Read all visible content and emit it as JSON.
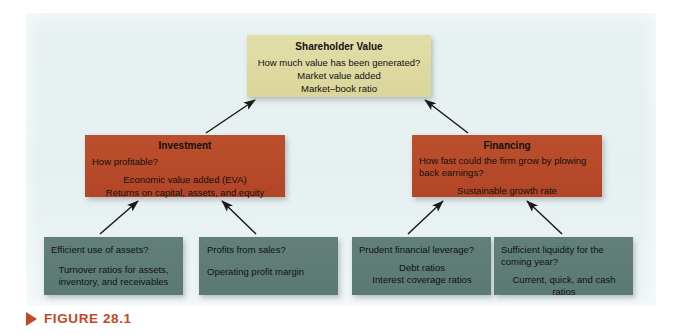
{
  "figure": {
    "caption": "FIGURE 28.1",
    "marker_icon": "triangle-right-icon",
    "caption_color": "#c0492a",
    "panel_background": "#e7f1f2"
  },
  "colors": {
    "top_box": "#ddd9a1",
    "mid_box": "#b8492a",
    "bottom_box": "#5e8078",
    "text": "#111111",
    "arrow": "#1a1a1a"
  },
  "diagram": {
    "type": "hierarchy",
    "levels": [
      {
        "level": 1,
        "nodes": [
          {
            "id": "shareholder-value",
            "title": "Shareholder Value",
            "question": "How much value has been generated?",
            "measures": [
              "Market value added",
              "Market–book ratio"
            ]
          }
        ]
      },
      {
        "level": 2,
        "nodes": [
          {
            "id": "investment",
            "title": "Investment",
            "question": "How profitable?",
            "measures": [
              "Economic value added (EVA)",
              "Returns on capital, assets, and equity"
            ]
          },
          {
            "id": "financing",
            "title": "Financing",
            "question": "How fast could the firm grow by plowing back earnings?",
            "measures": [
              "Sustainable growth rate"
            ]
          }
        ]
      },
      {
        "level": 3,
        "nodes": [
          {
            "id": "efficient-assets",
            "question": "Efficient use of assets?",
            "measures": [
              "Turnover ratios for assets,",
              "inventory, and receivables"
            ]
          },
          {
            "id": "profits-sales",
            "question": "Profits from sales?",
            "measures": [
              "Operating profit margin"
            ]
          },
          {
            "id": "prudent-leverage",
            "question": "Prudent financial leverage?",
            "measures": [
              "Debt ratios",
              "Interest coverage ratios"
            ]
          },
          {
            "id": "sufficient-liquidity",
            "question": "Sufficient liquidity for the coming year?",
            "measures": [
              "Current, quick, and cash",
              "ratios"
            ]
          }
        ]
      }
    ],
    "edges": [
      {
        "from": "investment",
        "to": "shareholder-value"
      },
      {
        "from": "financing",
        "to": "shareholder-value"
      },
      {
        "from": "efficient-assets",
        "to": "investment"
      },
      {
        "from": "profits-sales",
        "to": "investment"
      },
      {
        "from": "prudent-leverage",
        "to": "financing"
      },
      {
        "from": "sufficient-liquidity",
        "to": "financing"
      }
    ]
  }
}
